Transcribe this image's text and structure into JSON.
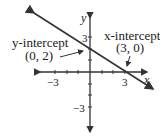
{
  "diagram": {
    "axes": {
      "x_label": "x",
      "y_label": "y",
      "ticks": {
        "x_neg": "−3",
        "x_pos": "3",
        "y_pos": "3",
        "y_neg": "−3"
      }
    },
    "line": {
      "description": "line through (0, 2) and (3, 0)",
      "color": "#333333"
    },
    "annotations": {
      "y_intercept": {
        "title": "y-intercept",
        "point": "(0, 2)"
      },
      "x_intercept": {
        "title": "x-intercept",
        "point": "(3, 0)"
      }
    }
  }
}
